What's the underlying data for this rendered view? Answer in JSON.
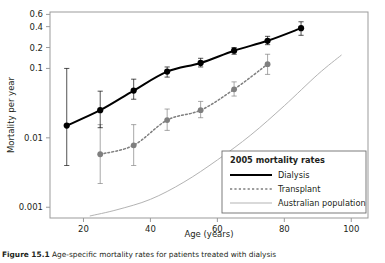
{
  "figure": {
    "caption_label": "Figure 15.1",
    "caption_text": "Age-specific mortality rates for patients treated with dialysis"
  },
  "chart_data": {
    "type": "line",
    "title": "",
    "xlabel": "Age (years)",
    "ylabel": "Mortality per year",
    "yscale": "log",
    "ylim": [
      0.0007,
      0.65
    ],
    "xlim": [
      10,
      105
    ],
    "grid": false,
    "x_ticks": [
      20,
      40,
      60,
      80,
      100
    ],
    "y_ticks": [
      0.001,
      0.01,
      0.1,
      0.2,
      0.4,
      0.6
    ],
    "y_tick_labels": [
      "0.001",
      "0.01",
      "0.1",
      "0.2",
      "0.4",
      "0.6"
    ],
    "legend_position": "bottom-right",
    "legend_title": "2005 mortality rates",
    "series": [
      {
        "name": "Dialysis",
        "style": "solid",
        "color": "#000000",
        "marker": "circle",
        "x": [
          15,
          25,
          35,
          45,
          55,
          65,
          75,
          85
        ],
        "values": [
          0.015,
          0.025,
          0.048,
          0.09,
          0.12,
          0.18,
          0.25,
          0.38
        ],
        "err_low": [
          0.004,
          0.014,
          0.036,
          0.075,
          0.105,
          0.16,
          0.22,
          0.3
        ],
        "err_high": [
          0.1,
          0.047,
          0.07,
          0.105,
          0.14,
          0.2,
          0.29,
          0.47
        ]
      },
      {
        "name": "Transplant",
        "style": "dotted",
        "color": "#7f7f7f",
        "marker": "circle",
        "x": [
          25,
          35,
          45,
          55,
          65,
          75
        ],
        "values": [
          0.0058,
          0.0078,
          0.018,
          0.025,
          0.05,
          0.115
        ],
        "err_low": [
          0.0022,
          0.004,
          0.0128,
          0.0195,
          0.04,
          0.082
        ],
        "err_high": [
          0.0155,
          0.0155,
          0.026,
          0.0335,
          0.064,
          0.16
        ]
      },
      {
        "name": "Australian population",
        "style": "thin-solid",
        "color": "#b3b3b3",
        "marker": "none",
        "x": [
          22,
          30,
          40,
          50,
          60,
          70,
          80,
          90,
          97
        ],
        "values": [
          0.00075,
          0.00092,
          0.0013,
          0.0023,
          0.0048,
          0.011,
          0.029,
          0.082,
          0.155
        ]
      }
    ]
  }
}
